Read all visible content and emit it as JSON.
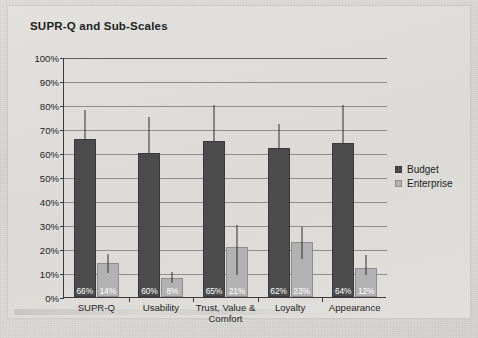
{
  "figure": {
    "background_color": "#dcdbd8",
    "page_color": "#d9d9d6"
  },
  "chart_data": {
    "type": "bar",
    "title": "SUPR-Q and Sub-Scales",
    "xlabel": "",
    "ylabel": "",
    "ylim": [
      0,
      100
    ],
    "ytick_labels": [
      "100%",
      "90%",
      "80%",
      "70%",
      "60%",
      "50%",
      "40%",
      "30%",
      "20%",
      "10%",
      "0%"
    ],
    "ytick_values": [
      100,
      90,
      80,
      70,
      60,
      50,
      40,
      30,
      20,
      10,
      0
    ],
    "grid": true,
    "legend_position": "right",
    "categories": [
      "SUPR-Q",
      "Usability",
      "Trust, Value & Comfort",
      "Loyalty",
      "Appearance"
    ],
    "series": [
      {
        "name": "Budget",
        "color": "#4b4b4b",
        "values": [
          66,
          60,
          65,
          62,
          64
        ],
        "value_labels": [
          "66%",
          "60%",
          "65%",
          "62%",
          "64%"
        ],
        "error_upper": [
          78,
          75,
          80,
          72,
          80
        ],
        "error_lower": [
          66,
          60,
          65,
          62,
          64
        ]
      },
      {
        "name": "Enterprise",
        "color": "#b2b2b2",
        "values": [
          14,
          8,
          21,
          23,
          12
        ],
        "value_labels": [
          "14%",
          "8%",
          "21%",
          "23%",
          "12%"
        ],
        "error_upper": [
          18,
          10.5,
          30,
          29,
          17.5
        ],
        "error_lower": [
          10,
          6,
          9,
          16,
          9
        ]
      }
    ]
  },
  "legend": {
    "items": [
      {
        "label": "Budget",
        "key": "budget"
      },
      {
        "label": "Enterprise",
        "key": "enterprise"
      }
    ]
  }
}
